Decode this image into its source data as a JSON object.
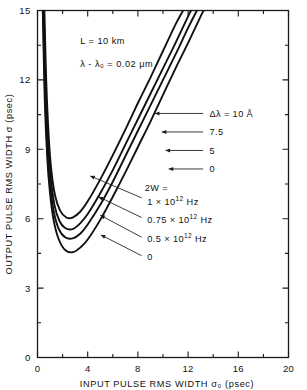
{
  "chart_data": {
    "type": "line",
    "title": "",
    "xlabel": "INPUT PULSE RMS WIDTH σ₀  (psec)",
    "ylabel": "OUTPUT PULSE RMS WIDTH σ  (psec)",
    "xlim": [
      0,
      20
    ],
    "ylim": [
      0,
      15
    ],
    "xticks": [
      0,
      4,
      8,
      12,
      16,
      20
    ],
    "yticks": [
      0,
      3,
      6,
      9,
      12,
      15
    ],
    "xtick_labels": [
      "0",
      "4",
      "8",
      "12",
      "16",
      "20"
    ],
    "ytick_labels": [
      "0",
      "3",
      "6",
      "9",
      "12",
      "15"
    ],
    "x_minor_step": 2,
    "y_minor_step": 1.5,
    "grid": false,
    "legend_position": "inline-annotations",
    "annotations": [
      {
        "id": "ann-L",
        "text": "L = 10 km",
        "x": 3.4,
        "y": 13.55
      },
      {
        "id": "ann-lambda",
        "text": "λ - λ₀ = 0.02 μm",
        "x": 3.4,
        "y": 12.55
      }
    ],
    "series": [
      {
        "name": "Δλ = 10 Å",
        "group": "delta-lambda",
        "label": "Δλ = 10 Å",
        "label_x": 13.7,
        "label_y": 10.55,
        "arrow_from_x": 13.2,
        "arrow_from_y": 10.55,
        "arrow_to_x": 9.35,
        "arrow_to_y": 10.55,
        "points": [
          [
            0.55,
            15.0
          ],
          [
            0.7,
            11.9
          ],
          [
            0.9,
            9.5
          ],
          [
            1.1,
            8.1
          ],
          [
            1.4,
            7.0
          ],
          [
            1.8,
            6.35
          ],
          [
            2.3,
            6.05
          ],
          [
            2.8,
            6.05
          ],
          [
            3.4,
            6.3
          ],
          [
            4.0,
            6.75
          ],
          [
            5.0,
            7.7
          ],
          [
            6.0,
            8.75
          ],
          [
            7.0,
            9.85
          ],
          [
            8.0,
            11.0
          ],
          [
            9.0,
            12.1
          ],
          [
            10.0,
            13.25
          ],
          [
            11.0,
            14.4
          ],
          [
            11.6,
            15.0
          ]
        ]
      },
      {
        "name": "Δλ = 7.5",
        "group": "delta-lambda",
        "label": "7.5",
        "label_x": 13.7,
        "label_y": 9.75,
        "arrow_from_x": 13.2,
        "arrow_from_y": 9.75,
        "arrow_to_x": 9.9,
        "arrow_to_y": 9.75,
        "points": [
          [
            0.5,
            15.0
          ],
          [
            0.65,
            11.6
          ],
          [
            0.85,
            9.2
          ],
          [
            1.05,
            7.8
          ],
          [
            1.35,
            6.6
          ],
          [
            1.75,
            5.9
          ],
          [
            2.2,
            5.6
          ],
          [
            2.8,
            5.55
          ],
          [
            3.4,
            5.8
          ],
          [
            4.0,
            6.2
          ],
          [
            5.0,
            7.1
          ],
          [
            6.0,
            8.1
          ],
          [
            7.0,
            9.2
          ],
          [
            8.0,
            10.3
          ],
          [
            9.0,
            11.4
          ],
          [
            10.0,
            12.5
          ],
          [
            11.0,
            13.6
          ],
          [
            12.0,
            14.75
          ],
          [
            12.25,
            15.0
          ]
        ]
      },
      {
        "name": "Δλ = 5",
        "group": "delta-lambda",
        "label": "5",
        "label_x": 13.7,
        "label_y": 8.95,
        "arrow_from_x": 13.2,
        "arrow_from_y": 8.95,
        "arrow_to_x": 10.2,
        "arrow_to_y": 8.95,
        "points": [
          [
            0.45,
            15.0
          ],
          [
            0.6,
            11.4
          ],
          [
            0.8,
            8.9
          ],
          [
            1.0,
            7.5
          ],
          [
            1.3,
            6.3
          ],
          [
            1.7,
            5.55
          ],
          [
            2.2,
            5.2
          ],
          [
            2.8,
            5.15
          ],
          [
            3.4,
            5.35
          ],
          [
            4.0,
            5.75
          ],
          [
            5.0,
            6.6
          ],
          [
            6.0,
            7.6
          ],
          [
            7.0,
            8.7
          ],
          [
            8.0,
            9.8
          ],
          [
            9.0,
            10.9
          ],
          [
            10.0,
            12.0
          ],
          [
            11.0,
            13.1
          ],
          [
            12.0,
            14.25
          ],
          [
            12.7,
            15.0
          ]
        ]
      },
      {
        "name": "Δλ = 0",
        "group": "delta-lambda",
        "label": "0",
        "label_x": 13.7,
        "label_y": 8.15,
        "arrow_from_x": 13.2,
        "arrow_from_y": 8.15,
        "arrow_to_x": 10.45,
        "arrow_to_y": 8.15,
        "points": [
          [
            0.42,
            15.0
          ],
          [
            0.58,
            11.1
          ],
          [
            0.78,
            8.6
          ],
          [
            0.98,
            7.2
          ],
          [
            1.28,
            5.95
          ],
          [
            1.7,
            5.1
          ],
          [
            2.2,
            4.65
          ],
          [
            2.8,
            4.55
          ],
          [
            3.4,
            4.75
          ],
          [
            4.0,
            5.1
          ],
          [
            5.0,
            5.95
          ],
          [
            6.0,
            6.95
          ],
          [
            7.0,
            8.0
          ],
          [
            8.0,
            9.1
          ],
          [
            9.0,
            10.2
          ],
          [
            10.0,
            11.35
          ],
          [
            11.0,
            12.5
          ],
          [
            12.0,
            13.6
          ],
          [
            13.0,
            14.75
          ],
          [
            13.25,
            15.0
          ]
        ]
      }
    ],
    "group_labels": [
      {
        "id": "label-2w-header",
        "text": "2W =",
        "x": 8.55,
        "y": 7.35
      },
      {
        "id": "label-2w-1",
        "text": "1 × 10¹² Hz",
        "rich": {
          "pre": "1 × 10",
          "sup": "12",
          "post": " Hz"
        },
        "x": 8.75,
        "y": 6.75,
        "arrow_from_x": 8.3,
        "arrow_from_y": 6.9,
        "arrow_to_x": 4.2,
        "arrow_to_y": 7.85
      },
      {
        "id": "label-2w-075",
        "text": "0.75 × 10¹² Hz",
        "rich": {
          "pre": "0.75 × 10",
          "sup": "12",
          "post": " Hz"
        },
        "x": 8.75,
        "y": 5.95,
        "arrow_from_x": 8.3,
        "arrow_from_y": 6.05,
        "arrow_to_x": 4.85,
        "arrow_to_y": 6.95
      },
      {
        "id": "label-2w-05",
        "text": "0.5 × 10¹² Hz",
        "rich": {
          "pre": "0.5 × 10",
          "sup": "12",
          "post": " Hz"
        },
        "x": 8.75,
        "y": 5.15,
        "arrow_from_x": 8.3,
        "arrow_from_y": 5.2,
        "arrow_to_x": 5.0,
        "arrow_to_y": 6.15
      },
      {
        "id": "label-2w-0",
        "text": "0",
        "x": 8.75,
        "y": 4.35,
        "arrow_from_x": 8.3,
        "arrow_from_y": 4.4,
        "arrow_to_x": 5.05,
        "arrow_to_y": 5.3
      }
    ],
    "secondary_series": [
      {
        "name": "2W = 0.75×10¹² Hz family",
        "group": "two-w",
        "points": [
          [
            0.5,
            15.0
          ],
          [
            0.65,
            11.6
          ],
          [
            0.85,
            9.2
          ],
          [
            1.05,
            7.8
          ],
          [
            1.35,
            6.6
          ],
          [
            1.75,
            5.9
          ],
          [
            2.2,
            5.6
          ],
          [
            2.8,
            5.55
          ],
          [
            3.4,
            5.8
          ],
          [
            4.0,
            6.2
          ],
          [
            5.0,
            7.1
          ],
          [
            6.0,
            8.1
          ],
          [
            7.0,
            9.2
          ],
          [
            8.0,
            10.3
          ],
          [
            9.0,
            11.4
          ],
          [
            10.0,
            12.5
          ],
          [
            11.0,
            13.6
          ],
          [
            12.0,
            14.75
          ],
          [
            12.25,
            15.0
          ]
        ]
      }
    ]
  },
  "figure": {
    "axis_color": "#1a1a1a",
    "curve_color": "#111111",
    "background": "#ffffff"
  }
}
